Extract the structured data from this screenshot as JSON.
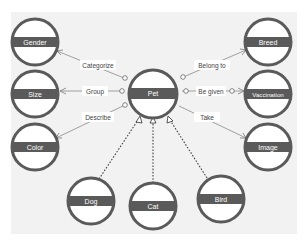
{
  "diagram": {
    "center": {
      "id": "pet",
      "label": "Pet",
      "cx": 153,
      "cy": 94,
      "r": 24
    },
    "nodes": [
      {
        "id": "gender",
        "label": "Gender",
        "cx": 35,
        "cy": 42,
        "r": 23
      },
      {
        "id": "size",
        "label": "Size",
        "cx": 35,
        "cy": 94,
        "r": 23
      },
      {
        "id": "color",
        "label": "Color",
        "cx": 35,
        "cy": 147,
        "r": 23
      },
      {
        "id": "breed",
        "label": "Breed",
        "cx": 268,
        "cy": 42,
        "r": 23
      },
      {
        "id": "vaccination",
        "label": "Vaccination",
        "cx": 268,
        "cy": 94,
        "r": 23
      },
      {
        "id": "image",
        "label": "Image",
        "cx": 268,
        "cy": 147,
        "r": 23
      },
      {
        "id": "dog",
        "label": "Dog",
        "cx": 91,
        "cy": 201,
        "r": 23
      },
      {
        "id": "cat",
        "label": "Cat",
        "cx": 153,
        "cy": 206,
        "r": 23
      },
      {
        "id": "bird",
        "label": "Bird",
        "cx": 221,
        "cy": 199,
        "r": 23
      }
    ],
    "relations": [
      {
        "from": "pet",
        "to": "gender",
        "label": "Categorize",
        "type": "association"
      },
      {
        "from": "pet",
        "to": "size",
        "label": "Group",
        "type": "association"
      },
      {
        "from": "pet",
        "to": "color",
        "label": "Describe",
        "type": "association"
      },
      {
        "from": "pet",
        "to": "breed",
        "label": "Belong to",
        "type": "association"
      },
      {
        "from": "pet",
        "to": "vaccination",
        "label": "Be given",
        "type": "association"
      },
      {
        "from": "pet",
        "to": "image",
        "label": "Take",
        "type": "association"
      },
      {
        "from": "dog",
        "to": "pet",
        "label": "",
        "type": "inheritance"
      },
      {
        "from": "cat",
        "to": "pet",
        "label": "",
        "type": "inheritance"
      },
      {
        "from": "bird",
        "to": "pet",
        "label": "",
        "type": "inheritance"
      }
    ],
    "colors": {
      "node_stroke": "#5a5a5a",
      "node_fill": "#ffffff",
      "band": "#5a5a5a",
      "panel": "#f2f2f2"
    }
  }
}
